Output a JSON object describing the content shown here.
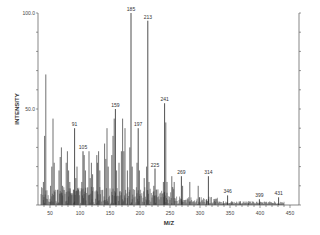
{
  "chart_data": {
    "type": "bar",
    "subtype": "mass-spectrum",
    "title": "",
    "xlabel": "M/Z",
    "ylabel": "INTENSITY",
    "xlim": [
      30,
      460
    ],
    "ylim": [
      0,
      100
    ],
    "x_ticks": [
      50,
      100,
      150,
      200,
      250,
      300,
      350,
      400,
      450
    ],
    "y_tick_labels": [
      "100.0",
      "50.0"
    ],
    "grid": false,
    "legend": null,
    "labeled_peaks": [
      {
        "mz": 91,
        "intensity": 40
      },
      {
        "mz": 105,
        "intensity": 28
      },
      {
        "mz": 159,
        "intensity": 50
      },
      {
        "mz": 185,
        "intensity": 100
      },
      {
        "mz": 197,
        "intensity": 40
      },
      {
        "mz": 213,
        "intensity": 96
      },
      {
        "mz": 225,
        "intensity": 19
      },
      {
        "mz": 241,
        "intensity": 53
      },
      {
        "mz": 269,
        "intensity": 15
      },
      {
        "mz": 314,
        "intensity": 15
      },
      {
        "mz": 346,
        "intensity": 5
      },
      {
        "mz": 399,
        "intensity": 3
      },
      {
        "mz": 431,
        "intensity": 4
      }
    ],
    "other_peaks": [
      {
        "mz": 39,
        "intensity": 12
      },
      {
        "mz": 41,
        "intensity": 36
      },
      {
        "mz": 43,
        "intensity": 68
      },
      {
        "mz": 51,
        "intensity": 10
      },
      {
        "mz": 53,
        "intensity": 20
      },
      {
        "mz": 55,
        "intensity": 45
      },
      {
        "mz": 57,
        "intensity": 22
      },
      {
        "mz": 63,
        "intensity": 8
      },
      {
        "mz": 65,
        "intensity": 18
      },
      {
        "mz": 67,
        "intensity": 25
      },
      {
        "mz": 69,
        "intensity": 30
      },
      {
        "mz": 71,
        "intensity": 10
      },
      {
        "mz": 77,
        "intensity": 22
      },
      {
        "mz": 79,
        "intensity": 28
      },
      {
        "mz": 81,
        "intensity": 18
      },
      {
        "mz": 83,
        "intensity": 12
      },
      {
        "mz": 85,
        "intensity": 6
      },
      {
        "mz": 89,
        "intensity": 8
      },
      {
        "mz": 93,
        "intensity": 14
      },
      {
        "mz": 95,
        "intensity": 20
      },
      {
        "mz": 97,
        "intensity": 8
      },
      {
        "mz": 103,
        "intensity": 12
      },
      {
        "mz": 107,
        "intensity": 26
      },
      {
        "mz": 109,
        "intensity": 18
      },
      {
        "mz": 115,
        "intensity": 28
      },
      {
        "mz": 117,
        "intensity": 14
      },
      {
        "mz": 119,
        "intensity": 22
      },
      {
        "mz": 121,
        "intensity": 16
      },
      {
        "mz": 128,
        "intensity": 26
      },
      {
        "mz": 129,
        "intensity": 22
      },
      {
        "mz": 131,
        "intensity": 28
      },
      {
        "mz": 133,
        "intensity": 18
      },
      {
        "mz": 141,
        "intensity": 32
      },
      {
        "mz": 143,
        "intensity": 24
      },
      {
        "mz": 145,
        "intensity": 40
      },
      {
        "mz": 147,
        "intensity": 20
      },
      {
        "mz": 153,
        "intensity": 26
      },
      {
        "mz": 155,
        "intensity": 36
      },
      {
        "mz": 157,
        "intensity": 45
      },
      {
        "mz": 161,
        "intensity": 18
      },
      {
        "mz": 165,
        "intensity": 22
      },
      {
        "mz": 169,
        "intensity": 28
      },
      {
        "mz": 171,
        "intensity": 45
      },
      {
        "mz": 173,
        "intensity": 28
      },
      {
        "mz": 175,
        "intensity": 40
      },
      {
        "mz": 179,
        "intensity": 18
      },
      {
        "mz": 183,
        "intensity": 30
      },
      {
        "mz": 187,
        "intensity": 20
      },
      {
        "mz": 195,
        "intensity": 22
      },
      {
        "mz": 199,
        "intensity": 18
      },
      {
        "mz": 207,
        "intensity": 14
      },
      {
        "mz": 211,
        "intensity": 20
      },
      {
        "mz": 215,
        "intensity": 12
      },
      {
        "mz": 223,
        "intensity": 10
      },
      {
        "mz": 227,
        "intensity": 8
      },
      {
        "mz": 239,
        "intensity": 12
      },
      {
        "mz": 243,
        "intensity": 43
      },
      {
        "mz": 245,
        "intensity": 12
      },
      {
        "mz": 253,
        "intensity": 15
      },
      {
        "mz": 257,
        "intensity": 12
      },
      {
        "mz": 271,
        "intensity": 10
      },
      {
        "mz": 283,
        "intensity": 12
      },
      {
        "mz": 297,
        "intensity": 10
      },
      {
        "mz": 299,
        "intensity": 4
      },
      {
        "mz": 311,
        "intensity": 3
      },
      {
        "mz": 325,
        "intensity": 3
      },
      {
        "mz": 339,
        "intensity": 2
      },
      {
        "mz": 353,
        "intensity": 2
      },
      {
        "mz": 367,
        "intensity": 2
      },
      {
        "mz": 381,
        "intensity": 1
      }
    ]
  }
}
